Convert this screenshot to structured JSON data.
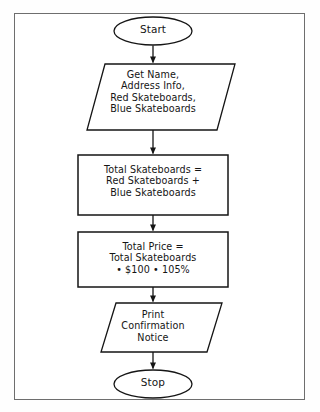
{
  "diagram": {
    "type": "flowchart",
    "orientation": "top-to-bottom",
    "border_color": "#6e6e6e",
    "stroke_color": "#151515",
    "background_color": "#ffffff",
    "nodes": [
      {
        "id": "start",
        "shape": "terminator",
        "label": "Start"
      },
      {
        "id": "input",
        "shape": "parallelogram",
        "role": "input",
        "label": "Get Name,\nAddress Info,\nRed Skateboards,\nBlue Skateboards",
        "lines": [
          "Get Name,",
          "Address Info,",
          "Red Skateboards,",
          "Blue Skateboards"
        ]
      },
      {
        "id": "calc-total-skateboards",
        "shape": "rectangle",
        "role": "process",
        "label": "Total Skateboards =\nRed Skateboards +\nBlue Skateboards",
        "lines": [
          "Total Skateboards =",
          "Red Skateboards +",
          "Blue Skateboards"
        ]
      },
      {
        "id": "calc-total-price",
        "shape": "rectangle",
        "role": "process",
        "label": "Total Price =\nTotal Skateboards\n• $100 • 105%",
        "lines": [
          "Total Price =",
          "Total Skateboards",
          "• $100 • 105%"
        ]
      },
      {
        "id": "output",
        "shape": "parallelogram",
        "role": "output",
        "label": "Print\nConfirmation\nNotice",
        "lines": [
          "Print",
          "Confirmation",
          "Notice"
        ]
      },
      {
        "id": "stop",
        "shape": "terminator",
        "label": "Stop"
      }
    ],
    "edges": [
      {
        "from": "start",
        "to": "input",
        "arrow": "down"
      },
      {
        "from": "input",
        "to": "calc-total-skateboards",
        "arrow": "down"
      },
      {
        "from": "calc-total-skateboards",
        "to": "calc-total-price",
        "arrow": "down"
      },
      {
        "from": "calc-total-price",
        "to": "output",
        "arrow": "down"
      },
      {
        "from": "output",
        "to": "stop",
        "arrow": "down"
      }
    ]
  }
}
